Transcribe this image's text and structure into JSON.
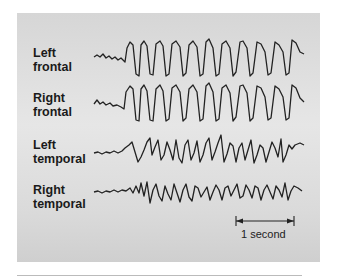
{
  "figure": {
    "channels": [
      {
        "line1": "Left",
        "line2": "frontal"
      },
      {
        "line1": "Right",
        "line2": "frontal"
      },
      {
        "line1": "Left",
        "line2": "temporal"
      },
      {
        "line1": "Right",
        "line2": "temporal"
      }
    ],
    "scale_bar": {
      "label": "1 second"
    },
    "colors": {
      "trace": "#222222",
      "panel": "#dcdcdc",
      "background": "#ffffff"
    }
  }
}
